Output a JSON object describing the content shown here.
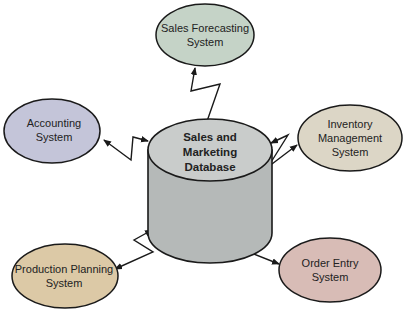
{
  "diagram": {
    "center": {
      "id": "database",
      "shape": "cylinder",
      "lines": [
        "Sales and",
        "Marketing",
        "Database"
      ],
      "fill_top": "#c9cccb",
      "fill_body": "#b5b9b8"
    },
    "nodes": [
      {
        "id": "sales-forecasting",
        "lines": [
          "Sales Forecasting",
          "System"
        ],
        "fill": "#c5d3c7"
      },
      {
        "id": "accounting",
        "lines": [
          "Accounting",
          "System"
        ],
        "fill": "#c4c5d9"
      },
      {
        "id": "inventory",
        "lines": [
          "Inventory",
          "Management",
          "System"
        ],
        "fill": "#dcd6c6"
      },
      {
        "id": "production-planning",
        "lines": [
          "Production Planning",
          "System"
        ],
        "fill": "#dcc9a6"
      },
      {
        "id": "order-entry",
        "lines": [
          "Order Entry",
          "System"
        ],
        "fill": "#d8bcb6"
      }
    ],
    "edges": [
      {
        "from": "database",
        "to": "sales-forecasting",
        "style": "lightning-bidirectional"
      },
      {
        "from": "database",
        "to": "accounting",
        "style": "lightning-bidirectional"
      },
      {
        "from": "database",
        "to": "inventory",
        "style": "lightning-bidirectional"
      },
      {
        "from": "database",
        "to": "production-planning",
        "style": "lightning-bidirectional"
      },
      {
        "from": "database",
        "to": "order-entry",
        "style": "lightning-bidirectional"
      }
    ]
  }
}
